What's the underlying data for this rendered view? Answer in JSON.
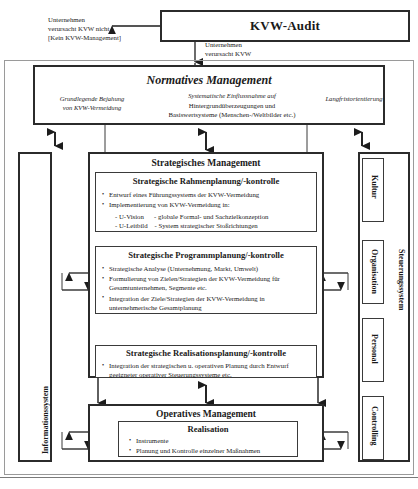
{
  "diagram": {
    "audit": {
      "title": "KVW-Audit"
    },
    "labels": {
      "left_branch_line1": "Unternehmen",
      "left_branch_line2": " verursacht KVW nicht",
      "left_branch_line3": "[Kein KVW-Management]",
      "down_branch_line1": "Unternehmen",
      "down_branch_line2": " verursacht KVW"
    },
    "normative": {
      "title": "Normatives Management",
      "left_line1": "Grundlegende Bejahung",
      "left_line2": "von KVW-Vermeidung",
      "center_line1": "Systematische Einflussnahme auf",
      "center_line2": "Hintergrundüberzeugungen und",
      "center_line3": "Basiswertsysteme (Menschen-/Weltbilder etc.)",
      "right_line1": "Langfristorientierung"
    },
    "strategic": {
      "title": "Strategisches Management",
      "blocks": [
        {
          "heading": "Strategische Rahmenplanung/-kontrolle",
          "bullets": [
            "Entwurf eines Führungssystems der KVW-Vermeidung",
            "Implementierung von KVW-Vermeidung in:"
          ],
          "sub": [
            "- U-Vision      - globale Formal- und Sachzielkonzeption",
            "- U-Leitbild    - System strategischer Stoßrichtungen"
          ]
        },
        {
          "heading": "Strategische Programmplanung/-kontrolle",
          "bullets": [
            "Strategische Analyse (Unternehmung, Markt, Umwelt)",
            "Formulierung von Zielen/Strategien der KVW-Vermeidung für Gesamtunternehmen, Segmente etc.",
            "Integration der Ziele/Strategien der KVW-Vermeidung in unternehmerische Gesamtplanung"
          ],
          "sub": []
        },
        {
          "heading": "Strategische Realisationsplanung/-kontrolle",
          "bullets": [
            "Integration der strategischen u. operativen Planung durch Entwurf geeigneter operativer Steuerungssysteme etc."
          ],
          "sub": []
        }
      ]
    },
    "operative": {
      "title": "Operatives Management",
      "block": {
        "heading": "Realisation",
        "bullets": [
          "Instrumente",
          "Planung und Kontrolle einzelner Maßnahmen"
        ]
      }
    },
    "left_system": {
      "label": "Informationssystem"
    },
    "right_system": {
      "label": "Steuerungssystem",
      "items": [
        {
          "label": "Kultur"
        },
        {
          "label": "Organisation"
        },
        {
          "label": "Personal"
        },
        {
          "label": "Controlling"
        }
      ]
    },
    "colors": {
      "stroke": "#2b2b2b",
      "thin_stroke": "#3a3a3a",
      "background": "#ffffff"
    }
  }
}
